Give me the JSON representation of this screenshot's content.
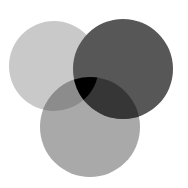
{
  "diagram": {
    "type": "venn-3",
    "background": "#ffffff",
    "circles": [
      {
        "id": "A",
        "position": "top-left",
        "cx": 54,
        "cy": 66,
        "r": 45,
        "color": "#c9c9c9"
      },
      {
        "id": "B",
        "position": "top-right",
        "cx": 123,
        "cy": 69,
        "r": 50,
        "color": "#575757"
      },
      {
        "id": "C",
        "position": "bottom",
        "cx": 90,
        "cy": 127,
        "r": 50,
        "color": "#a9a9a9"
      }
    ],
    "intersections": {
      "AB": "#575757",
      "AC": "#8c8c8c",
      "BC": "#363636",
      "ABC": "#000000"
    }
  }
}
